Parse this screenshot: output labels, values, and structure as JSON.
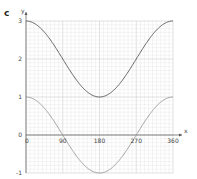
{
  "part_label": "c",
  "chart_data": {
    "type": "line",
    "title": "",
    "xlabel": "x",
    "ylabel": "y",
    "xlim": [
      0,
      360
    ],
    "ylim": [
      -1,
      3
    ],
    "grid": true,
    "x_ticks": [
      0,
      90,
      180,
      270,
      360
    ],
    "y_ticks": [
      -1,
      0,
      1,
      2,
      3
    ],
    "x_tick_labels": [
      "0",
      "90",
      "180",
      "270",
      "360"
    ],
    "y_tick_labels": [
      "-1",
      "0",
      "1",
      "2",
      "3"
    ],
    "series": [
      {
        "name": "y = cos x + 2",
        "color": "#555555",
        "x": [
          0,
          30,
          60,
          90,
          120,
          150,
          180,
          210,
          240,
          270,
          300,
          330,
          360
        ],
        "values": [
          3,
          2.87,
          2.5,
          2,
          1.5,
          1.13,
          1,
          1.13,
          1.5,
          2,
          2.5,
          2.87,
          3
        ]
      },
      {
        "name": "y = cos x",
        "color": "#999999",
        "x": [
          0,
          30,
          60,
          90,
          120,
          150,
          180,
          210,
          240,
          270,
          300,
          330,
          360
        ],
        "values": [
          1,
          0.87,
          0.5,
          0,
          -0.5,
          -0.87,
          -1,
          -0.87,
          -0.5,
          0,
          0.5,
          0.87,
          1
        ]
      }
    ]
  },
  "colors": {
    "grid_minor": "#e2e2e2",
    "grid_major": "#cfcfcf",
    "axis": "#555555"
  }
}
